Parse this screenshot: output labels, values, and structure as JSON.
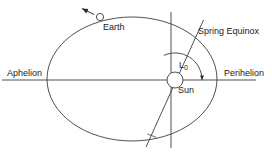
{
  "figure": {
    "background_color": "#ffffff",
    "line_color": "#3d3d3d",
    "text_color": "#1a1a1a",
    "width": 272,
    "height": 160
  },
  "labels": {
    "aphelion": "Aphelion",
    "perihelion": "Perihelion",
    "earth": "Earth",
    "sun": "Sun",
    "spring_equinox": "Spring Equinox",
    "l0_symbol": "L",
    "l0_subscript": "0"
  },
  "geometry": {
    "ellipse": {
      "center_x": 132,
      "center_y": 79,
      "radius_x": 85,
      "radius_y": 62
    },
    "sun": {
      "center_x": 175,
      "center_y": 80,
      "radius": 8
    },
    "earth": {
      "center_x": 100,
      "center_y": 17,
      "radius": 3.5
    },
    "major_axis_line": {
      "x1": 2,
      "y1": 80,
      "x2": 256,
      "y2": 80
    },
    "vertical_line": {
      "x1": 171,
      "y1": 12,
      "x2": 171,
      "y2": 148
    },
    "equinox_line": {
      "x1": 203,
      "y1": 20,
      "x2": 146,
      "y2": 147
    },
    "angle_arc": {
      "center_x": 175,
      "center_y": 80,
      "radius": 27,
      "start_deg": 114,
      "end_deg": 0
    },
    "motion_arrow": {
      "x1": 93,
      "y1": 14,
      "x2": 81,
      "y2": 8
    }
  }
}
